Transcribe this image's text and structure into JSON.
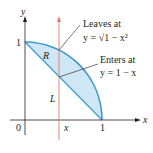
{
  "axes": {
    "x_label": "x",
    "y_label": "y",
    "origin_label": "0",
    "x_tick_1": "1",
    "y_tick_1": "1",
    "x_variable_label": "x"
  },
  "regions": {
    "R_label": "R",
    "L_label": "L"
  },
  "annotations": {
    "leaves_title": "Leaves at",
    "leaves_eq": "y = √1 − x²",
    "enters_title": "Enters at",
    "enters_eq": "y = 1 − x"
  },
  "colors": {
    "region_fill": "#cfe6f5",
    "curve_stroke": "#3d9bd1",
    "vertical_line": "#e07a6a",
    "axis": "#231f20"
  }
}
